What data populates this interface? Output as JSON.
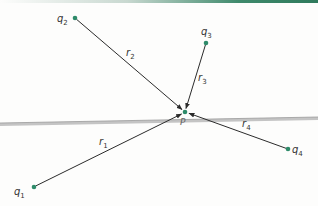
{
  "diagram": {
    "title": "",
    "colors": {
      "point": "#2e8b6a",
      "vector": "#2b2b2b",
      "band": "#b8b8b8",
      "top_band": "#2f7a5c"
    },
    "target": {
      "label": "P",
      "x": 185,
      "y": 112
    },
    "charges": [
      {
        "id": "q1",
        "base": "q",
        "sub": "1",
        "x": 34,
        "y": 187
      },
      {
        "id": "q2",
        "base": "q",
        "sub": "2",
        "x": 75,
        "y": 18
      },
      {
        "id": "q3",
        "base": "q",
        "sub": "3",
        "x": 206,
        "y": 43
      },
      {
        "id": "q4",
        "base": "q",
        "sub": "4",
        "x": 288,
        "y": 149
      }
    ],
    "vectors": [
      {
        "id": "r1",
        "base": "r",
        "sub": "1",
        "from": "q1",
        "to": "P"
      },
      {
        "id": "r2",
        "base": "r",
        "sub": "2",
        "from": "q2",
        "to": "P"
      },
      {
        "id": "r3",
        "base": "r",
        "sub": "3",
        "from": "q3",
        "to": "P"
      },
      {
        "id": "r4",
        "base": "r",
        "sub": "4",
        "from": "q4",
        "to": "P"
      }
    ]
  }
}
